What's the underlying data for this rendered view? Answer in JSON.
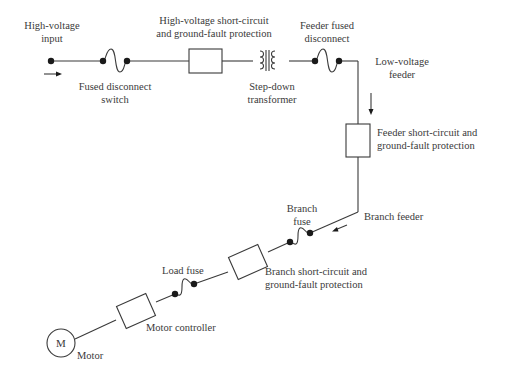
{
  "diagram": {
    "type": "one-line electrical distribution diagram",
    "colors": {
      "line": "#3a3a3a",
      "text": "#3a3a3a",
      "background": "#ffffff"
    },
    "labels": {
      "hv_input": [
        "High-voltage",
        "input"
      ],
      "fused_disconnect": [
        "Fused disconnect",
        "switch"
      ],
      "hv_protection": [
        "High-voltage short-circuit",
        "and ground-fault protection"
      ],
      "transformer": [
        "Step-down",
        "transformer"
      ],
      "feeder_fused_disconnect": [
        "Feeder fused",
        "disconnect"
      ],
      "lv_feeder": [
        "Low-voltage",
        "feeder"
      ],
      "feeder_protection": [
        "Feeder short-circuit and",
        "ground-fault protection"
      ],
      "branch_feeder": "Branch feeder",
      "branch_fuse": [
        "Branch",
        "fuse"
      ],
      "branch_protection": [
        "Branch short-circuit and",
        "ground-fault protection"
      ],
      "load_fuse": "Load fuse",
      "motor_controller": "Motor controller",
      "motor_symbol": "M",
      "motor": "Motor"
    },
    "components_in_order": [
      "High-voltage input",
      "Fused disconnect switch",
      "High-voltage short-circuit and ground-fault protection",
      "Step-down transformer",
      "Feeder fused disconnect",
      "Low-voltage feeder",
      "Feeder short-circuit and ground-fault protection",
      "Branch feeder",
      "Branch fuse",
      "Branch short-circuit and ground-fault protection",
      "Load fuse",
      "Motor controller",
      "Motor"
    ]
  }
}
